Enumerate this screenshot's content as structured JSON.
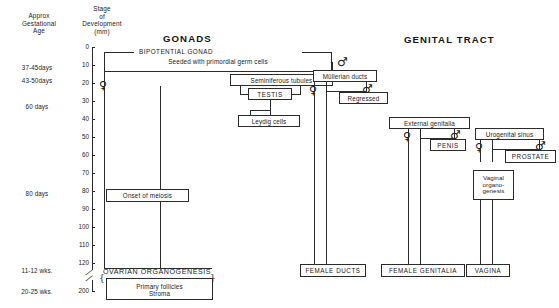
{
  "figure": {
    "titles": {
      "gonads": "GONADS",
      "genital_tract": "GENITAL TRACT"
    },
    "column_headers": {
      "age": "Approx\nGestational\nAge",
      "stage": "Stage\nof\nDevelopment\n(mm)"
    }
  },
  "axis": {
    "unit": "mm",
    "ticks": [
      "0",
      "10",
      "20",
      "30",
      "40",
      "50",
      "60",
      "70",
      "80",
      "90",
      "100",
      "110",
      "120",
      "200"
    ],
    "broken_between": [
      "120",
      "200"
    ]
  },
  "age_labels": [
    {
      "text": "37-45days"
    },
    {
      "text": "43-50days"
    },
    {
      "text": "60 days"
    },
    {
      "text": "80 days"
    },
    {
      "text": "11-12 wks."
    },
    {
      "text": "20-25 wks."
    }
  ],
  "gonads": {
    "bipotential_label": "BIPOTENTIAL GONAD",
    "seeded": "Seeded with  primordial germ cells",
    "female_symbol": "♀",
    "male_symbol": "♂",
    "seminiferous": "Seminiferous tubules",
    "testis": "TESTIS",
    "leydig": "Leydig cells",
    "onset_meiosis": "Onset of meiosis",
    "ovarian_organogenesis": "OVARIAN ORGANOGENESIS",
    "primary_follicles": "Primary follicles",
    "stroma": "Stroma"
  },
  "genital_tract": {
    "mullerian_ducts": "Müllerian ducts",
    "regressed": "Regressed",
    "female_ducts": "FEMALE DUCTS",
    "external_genitalia": "External genitalia",
    "penis": "PENIS",
    "female_genitalia": "FEMALE GENITALIA",
    "urogenital_sinus": "Urogenital sinus",
    "prostate": "PROSTATE",
    "vaginal_organogenesis": "Vaginal\norgano-\ngenesis",
    "vagina": "VAGINA",
    "female_symbol": "♀",
    "male_symbol": "♂"
  },
  "colors": {
    "ink": "#1a1a1a",
    "line": "#2b2b2b",
    "background": "#ffffff"
  }
}
